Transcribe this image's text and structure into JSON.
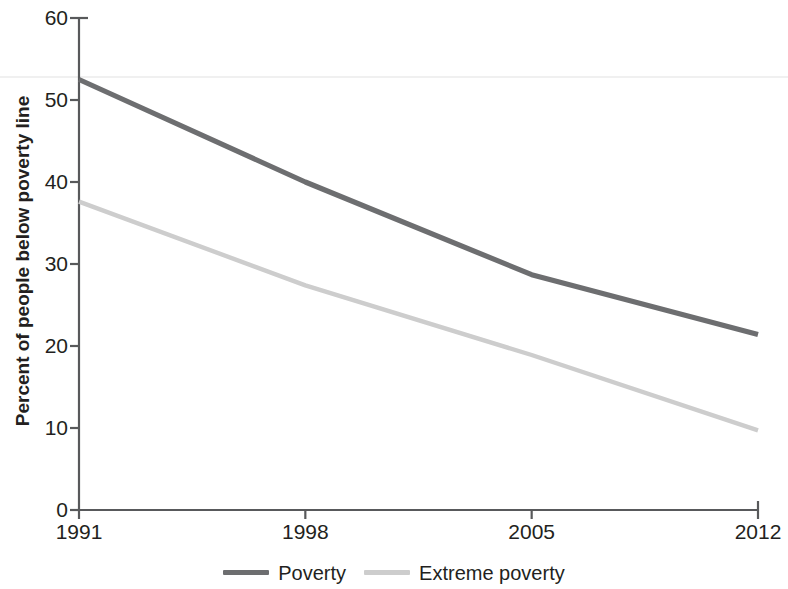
{
  "chart_data": {
    "type": "line",
    "title": "",
    "subtitle": "",
    "xlabel": "",
    "ylabel": "Percent of people below poverty line",
    "x": [
      1991,
      1998,
      2005,
      2012
    ],
    "xtick_labels": [
      "1991",
      "1998",
      "2005",
      "2012"
    ],
    "ytick_labels": [
      "0",
      "10",
      "20",
      "30",
      "40",
      "50",
      "60"
    ],
    "ytick_values": [
      0,
      10,
      20,
      30,
      40,
      50,
      60
    ],
    "xlim": [
      1991,
      2012
    ],
    "ylim": [
      0,
      60
    ],
    "grid": "single faint horizontal reference line near 52.8",
    "gridline_value": 52.8,
    "legend_position": "bottom-center",
    "series": [
      {
        "name": "Poverty",
        "color": "#6d6e70",
        "values": [
          52.5,
          40.0,
          28.7,
          21.4
        ]
      },
      {
        "name": "Extreme poverty",
        "color": "#cdcdcd",
        "values": [
          37.6,
          27.4,
          18.9,
          9.7
        ]
      }
    ]
  },
  "axes": {
    "y_title": "Percent of people below poverty line",
    "axis_color": "#58595b",
    "gridline_color": "#ebebeb"
  },
  "legend": {
    "entries": [
      {
        "label": "Poverty",
        "color": "#6d6e70"
      },
      {
        "label": "Extreme poverty",
        "color": "#cdcdcd"
      }
    ]
  }
}
